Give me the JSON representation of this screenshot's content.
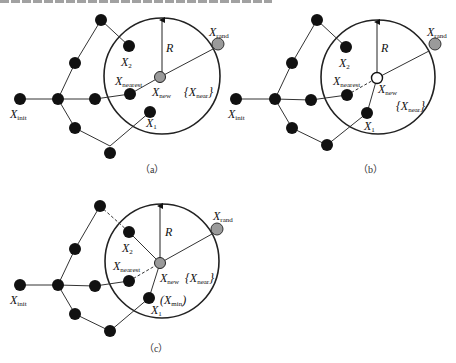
{
  "figure": {
    "panels": [
      {
        "id": "a",
        "caption": "（a）",
        "labels": {
          "init": "X",
          "init_sub": "init",
          "nearest": "X",
          "nearest_sub": "nearest",
          "new": "X",
          "new_sub": "new",
          "rand": "X",
          "rand_sub": "rand",
          "near": "{X",
          "near_sub": "near",
          "near_close": "}",
          "x1": "X",
          "x1_sub": "1",
          "x2": "X",
          "x2_sub": "2",
          "radius": "R"
        },
        "xnew_style": "grey-filled"
      },
      {
        "id": "b",
        "caption": "（b）",
        "labels": {
          "init": "X",
          "init_sub": "init",
          "nearest": "X",
          "nearest_sub": "nearest",
          "new": "X",
          "new_sub": "new",
          "rand": "X",
          "rand_sub": "rand",
          "near": "{X",
          "near_sub": "near",
          "near_close": "}",
          "x1": "X",
          "x1_sub": "1",
          "x2": "X",
          "x2_sub": "2",
          "radius": "R"
        },
        "xnew_style": "hollow"
      },
      {
        "id": "c",
        "caption": "（c）",
        "labels": {
          "init": "X",
          "init_sub": "init",
          "nearest": "X",
          "nearest_sub": "nearest",
          "new": "X",
          "new_sub": "new",
          "rand": "X",
          "rand_sub": "rand",
          "near": "{X",
          "near_sub": "near",
          "near_close": "}",
          "x1": "X",
          "x1_sub": "1",
          "x2": "X",
          "x2_sub": "2",
          "radius": "R",
          "xmin": "(X",
          "xmin_sub": "min",
          "xmin_close": ")"
        },
        "xnew_style": "grey-filled-rewired"
      }
    ],
    "colors": {
      "node": "#111111",
      "grey_node": "#9a9a9a",
      "edge": "#333333",
      "circle": "#222222"
    }
  }
}
